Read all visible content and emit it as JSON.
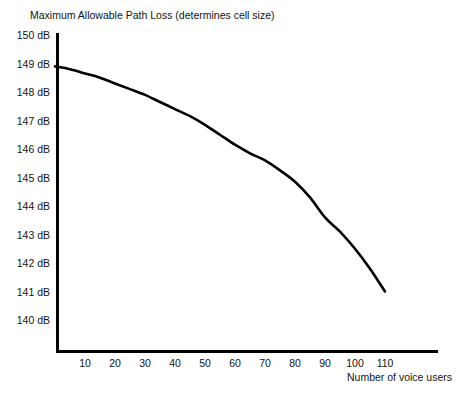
{
  "chart_data": {
    "type": "line",
    "title": "Maximum Allowable Path Loss (determines cell size)",
    "xlabel": "Number of voice users",
    "ylabel": "",
    "xlim": [
      0,
      120
    ],
    "ylim": [
      140,
      150
    ],
    "grid": false,
    "legend": null,
    "x_tick_labels": [
      "10",
      "20",
      "30",
      "40",
      "50",
      "60",
      "70",
      "80",
      "90",
      "100",
      "110"
    ],
    "x_ticks": [
      10,
      20,
      30,
      40,
      50,
      60,
      70,
      80,
      90,
      100,
      110
    ],
    "y_tick_labels": [
      "150 dB",
      "149 dB",
      "148 dB",
      "147 dB",
      "146 dB",
      "145 dB",
      "144 dB",
      "143 dB",
      "142 dB",
      "141 dB",
      "140 dB"
    ],
    "y_ticks": [
      150,
      149,
      148,
      147,
      146,
      145,
      144,
      143,
      142,
      141,
      140
    ],
    "series": [
      {
        "name": "Maximum allowable path loss",
        "color": "#000000",
        "x": [
          0,
          5,
          10,
          15,
          20,
          25,
          30,
          35,
          40,
          45,
          50,
          55,
          60,
          65,
          70,
          75,
          80,
          85,
          90,
          95,
          100,
          105,
          110
        ],
        "values": [
          148.9,
          148.8,
          148.65,
          148.5,
          148.3,
          148.1,
          147.9,
          147.65,
          147.4,
          147.15,
          146.85,
          146.5,
          146.15,
          145.85,
          145.6,
          145.25,
          144.85,
          144.3,
          143.6,
          143.1,
          142.5,
          141.8,
          141.0
        ]
      }
    ]
  },
  "axis": {
    "y_axis_name": "y-axis-line",
    "x_axis_name": "x-axis-line"
  },
  "caption": {
    "text": ""
  }
}
